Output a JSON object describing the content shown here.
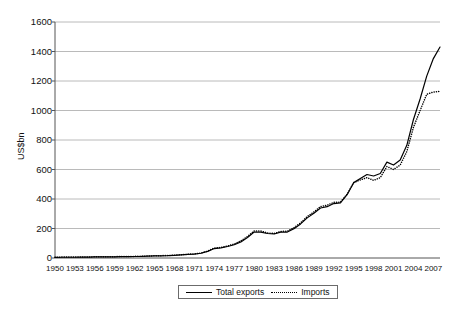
{
  "chart_data": {
    "type": "line",
    "title": "",
    "xlabel": "",
    "ylabel": "US$bn",
    "ylim": [
      0,
      1600
    ],
    "ytick_values": [
      0,
      200,
      400,
      600,
      800,
      1000,
      1200,
      1400,
      1600
    ],
    "ytick_labels": [
      "0",
      "200",
      "400",
      "600",
      "800",
      "1000",
      "1200",
      "1400",
      "1600"
    ],
    "grid": "horizontal",
    "legend_position": "bottom",
    "xlim": [
      1950,
      2008
    ],
    "xtick_labels": [
      "1950",
      "1953",
      "1956",
      "1959",
      "1962",
      "1965",
      "1968",
      "1971",
      "1974",
      "1977",
      "1980",
      "1983",
      "1986",
      "1989",
      "1992",
      "1995",
      "1998",
      "2001",
      "2004",
      "2007"
    ],
    "x": [
      1950,
      1951,
      1952,
      1953,
      1954,
      1955,
      1956,
      1957,
      1958,
      1959,
      1960,
      1961,
      1962,
      1963,
      1964,
      1965,
      1966,
      1967,
      1968,
      1969,
      1970,
      1971,
      1972,
      1973,
      1974,
      1975,
      1976,
      1977,
      1978,
      1979,
      1980,
      1981,
      1982,
      1983,
      1984,
      1985,
      1986,
      1987,
      1988,
      1989,
      1990,
      1991,
      1992,
      1993,
      1994,
      1995,
      1996,
      1997,
      1998,
      1999,
      2000,
      2001,
      2002,
      2003,
      2004,
      2005,
      2006,
      2007,
      2008
    ],
    "series": [
      {
        "name": "Total exports",
        "style": "solid",
        "color": "#000000",
        "values": [
          4,
          5,
          5,
          5,
          6,
          6,
          7,
          7,
          7,
          8,
          9,
          9,
          10,
          11,
          13,
          14,
          15,
          16,
          18,
          21,
          24,
          26,
          32,
          45,
          64,
          69,
          78,
          90,
          109,
          139,
          176,
          176,
          166,
          163,
          175,
          176,
          199,
          231,
          272,
          303,
          339,
          348,
          369,
          374,
          429,
          511,
          539,
          566,
          556,
          573,
          650,
          630,
          664,
          764,
          939,
          1078,
          1233,
          1352,
          1430
        ]
      },
      {
        "name": "Imports",
        "style": "dotted",
        "color": "#000000",
        "values": [
          5,
          6,
          6,
          6,
          7,
          7,
          8,
          8,
          8,
          9,
          10,
          10,
          11,
          12,
          13,
          15,
          16,
          17,
          19,
          22,
          25,
          28,
          34,
          47,
          68,
          71,
          81,
          95,
          116,
          146,
          183,
          183,
          170,
          166,
          180,
          182,
          206,
          238,
          281,
          312,
          349,
          358,
          377,
          379,
          432,
          511,
          529,
          545,
          526,
          545,
          620,
          600,
          630,
          722,
          886,
          1000,
          1110,
          1125,
          1130
        ]
      }
    ],
    "legend": [
      {
        "label": "Total exports",
        "style": "solid"
      },
      {
        "label": "Imports",
        "style": "dotted"
      }
    ]
  }
}
